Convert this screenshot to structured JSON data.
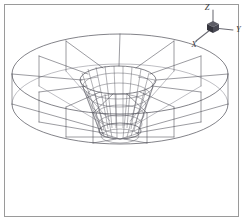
{
  "figure": {
    "background_color": "#ffffff",
    "frame_color": "#9a9a9a",
    "line_color": "#4a4a52"
  },
  "axis_triad": {
    "name": "orientation-triad",
    "origin": {
      "x": 213,
      "y": 26
    },
    "axes": [
      {
        "id": "z",
        "label": "Z",
        "direction": "up",
        "tip": {
          "x": 213,
          "y": 9
        },
        "label_pos": {
          "x": 210,
          "y": 9
        }
      },
      {
        "id": "y",
        "label": "Y",
        "direction": "right",
        "tip": {
          "x": 234,
          "y": 29
        },
        "label_pos": {
          "x": 234,
          "y": 30
        }
      },
      {
        "id": "x",
        "label": "X",
        "direction": "lower-left",
        "tip": {
          "x": 197,
          "y": 40
        },
        "label_pos": {
          "x": 194,
          "y": 45
        }
      }
    ],
    "cube_color_top": "#5d5d66",
    "cube_color_left": "#34343c",
    "cube_color_right": "#4a4a54"
  },
  "geometry": {
    "outer_ring": {
      "name": "outer-annulus",
      "top_ellipse": {
        "cx": 120,
        "cy": 74,
        "rx": 108,
        "ry": 40
      },
      "bottom_ellipse": {
        "cx": 120,
        "cy": 104,
        "rx": 108,
        "ry": 40
      },
      "wall_height_px": 30,
      "radial_sectors": 12
    },
    "inner_hole": {
      "name": "inner-bore",
      "top_ellipse": {
        "cx": 118,
        "cy": 80,
        "rx": 38,
        "ry": 14
      },
      "bottom_ellipse": {
        "cx": 120,
        "cy": 131,
        "rx": 21,
        "ry": 8
      }
    },
    "funnel": {
      "name": "central-funnel-hub",
      "top_rx": 38,
      "bottom_rx": 21,
      "top_cy": 80,
      "bottom_cy": 131,
      "meridians": 24,
      "rings": 6
    }
  }
}
